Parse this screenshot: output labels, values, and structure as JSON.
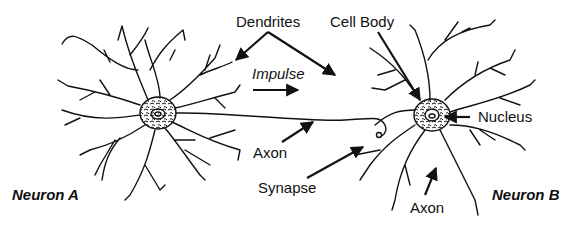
{
  "diagram": {
    "labels": {
      "dendrites": "Dendrites",
      "cell_body": "Cell Body",
      "impulse": "Impulse",
      "nucleus": "Nucleus",
      "axon_a": "Axon",
      "synapse": "Synapse",
      "axon_b": "Axon",
      "neuron_a": "Neuron A",
      "neuron_b": "Neuron B"
    },
    "colors": {
      "ink": "#111111",
      "background": "#ffffff"
    }
  }
}
